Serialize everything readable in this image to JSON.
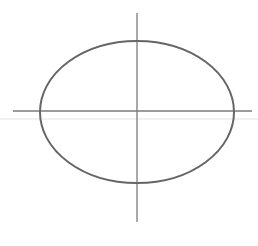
{
  "drawing": {
    "subject": "pencil sketch of ellipse with center crosshair",
    "stroke_color": "#6b6b6b",
    "guide_color": "#e2e2e2",
    "ellipse": {
      "cx": 137,
      "cy": 112,
      "rx": 97,
      "ry": 71
    },
    "horizontal_axis": {
      "x1": 13,
      "x2": 252,
      "y": 111
    },
    "vertical_axis": {
      "x": 137,
      "y1": 13,
      "y2": 222
    },
    "faint_guide": {
      "x1": 0,
      "x2": 258,
      "y": 119
    }
  }
}
